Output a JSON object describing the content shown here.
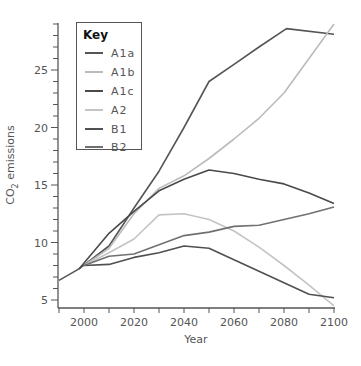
{
  "chart_data": {
    "type": "line",
    "title": "",
    "xlabel": "Year",
    "ylabel": "CO2 emissions",
    "ylabel_display": [
      "CO",
      "2",
      " emissions"
    ],
    "xlim": [
      1990,
      2100
    ],
    "ylim": [
      4.3,
      29.3
    ],
    "x_ticks": [
      2000,
      2020,
      2040,
      2060,
      2080,
      2100
    ],
    "x_minor_ticks": [
      1990,
      2010,
      2030,
      2050,
      2070,
      2090
    ],
    "y_ticks": [
      5,
      10,
      15,
      20,
      25
    ],
    "grid": false,
    "legend_position": "upper left (inside)",
    "legend_title": "Key",
    "series": [
      {
        "name": "A1a",
        "color": "#555555",
        "x": [
          1990,
          1998,
          2010,
          2020,
          2030,
          2040,
          2050,
          2060,
          2070,
          2081,
          2100
        ],
        "values": [
          6.7,
          7.7,
          9.7,
          13.0,
          16.2,
          20.0,
          24.0,
          25.5,
          27.0,
          28.6,
          28.1
        ]
      },
      {
        "name": "A1b",
        "color": "#bbbbbb",
        "x": [
          2000,
          2010,
          2020,
          2030,
          2040,
          2050,
          2060,
          2070,
          2080,
          2090,
          2100
        ],
        "values": [
          8.0,
          9.5,
          12.5,
          14.7,
          15.8,
          17.3,
          19.0,
          20.8,
          23.0,
          26.0,
          29.0
        ]
      },
      {
        "name": "A1c",
        "color": "#4a4a4a",
        "x": [
          1998,
          2010,
          2020,
          2030,
          2040,
          2050,
          2060,
          2070,
          2080,
          2090,
          2100
        ],
        "values": [
          7.7,
          10.8,
          12.7,
          14.5,
          15.5,
          16.3,
          16.0,
          15.5,
          15.1,
          14.3,
          13.4
        ]
      },
      {
        "name": "A2",
        "color": "#c4c4c4",
        "x": [
          2000,
          2010,
          2020,
          2030,
          2040,
          2050,
          2060,
          2070,
          2080,
          2090,
          2100
        ],
        "values": [
          8.0,
          9.1,
          10.3,
          12.4,
          12.5,
          12.0,
          11.0,
          9.6,
          8.0,
          6.3,
          4.5
        ]
      },
      {
        "name": "B1",
        "color": "#505050",
        "x": [
          2000,
          2010,
          2020,
          2030,
          2040,
          2050,
          2060,
          2070,
          2080,
          2090,
          2100
        ],
        "values": [
          8.0,
          8.1,
          8.7,
          9.1,
          9.7,
          9.5,
          8.5,
          7.5,
          6.5,
          5.5,
          5.2
        ]
      },
      {
        "name": "B2",
        "color": "#707070",
        "x": [
          2000,
          2010,
          2020,
          2030,
          2040,
          2050,
          2060,
          2070,
          2080,
          2090,
          2100
        ],
        "values": [
          8.0,
          8.8,
          9.0,
          9.8,
          10.6,
          10.9,
          11.4,
          11.5,
          12.0,
          12.5,
          13.1
        ]
      }
    ]
  },
  "legend": {
    "title": "Key",
    "items": [
      {
        "label": "A1a",
        "color": "#555555"
      },
      {
        "label": "A1b",
        "color": "#bbbbbb"
      },
      {
        "label": "A1c",
        "color": "#4a4a4a"
      },
      {
        "label": "A2",
        "color": "#c4c4c4"
      },
      {
        "label": "B1",
        "color": "#505050"
      },
      {
        "label": "B2",
        "color": "#707070"
      }
    ]
  },
  "axes": {
    "x_title": "Year",
    "y_title_main": "CO",
    "y_title_sub": "2",
    "y_title_rest": " emissions"
  }
}
